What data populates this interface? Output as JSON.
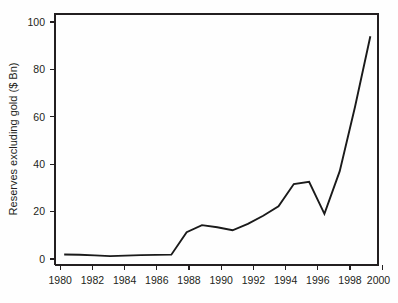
{
  "chart_data": {
    "type": "line",
    "title": "",
    "subtitle": "",
    "xlabel": "",
    "ylabel": "Reserves excluding gold ($ Bn)",
    "grid": false,
    "legend": "none",
    "xlim": [
      1979.4,
      2000.5
    ],
    "ylim": [
      -1.5,
      105.5
    ],
    "xticks": [
      1980,
      1982,
      1984,
      1986,
      1988,
      1990,
      1992,
      1994,
      1996,
      1998,
      2000
    ],
    "xtick_labels": [
      "1980",
      "1982",
      "1984",
      "1986",
      "1988",
      "1990",
      "1992",
      "1994",
      "1996",
      "1998",
      "2000"
    ],
    "yticks": [
      0,
      20,
      40,
      60,
      80,
      100
    ],
    "ytick_labels": [
      "0",
      "20",
      "40",
      "60",
      "80",
      "100"
    ],
    "x": [
      1980,
      1981,
      1982,
      1983,
      1984,
      1985,
      1986,
      1987,
      1988,
      1989,
      1990,
      1991,
      1992,
      1993,
      1994,
      1995,
      1996,
      1997,
      1998,
      1999,
      2000
    ],
    "series": [
      {
        "name": "Reserves excluding gold",
        "color": "#1a1a1a",
        "values": [
          3.0,
          2.9,
          2.6,
          2.3,
          2.5,
          2.7,
          2.8,
          2.9,
          12.5,
          15.5,
          14.6,
          13.3,
          16.0,
          19.5,
          23.5,
          33.0,
          34.0,
          20.3,
          38.5,
          66.0,
          96.0
        ]
      }
    ]
  },
  "axes": {
    "y_axis_title": "Reserves excluding gold ($ Bn)"
  }
}
